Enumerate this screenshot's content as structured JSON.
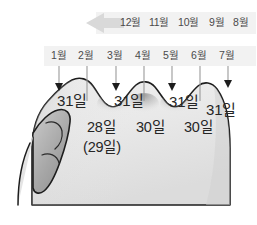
{
  "diagram": {
    "colors": {
      "hand_fill": "#e9e9e9",
      "hand_outline": "#1d1d1d",
      "thumb_fill": "#a8a8a8",
      "band_bg": "#f2f2f2",
      "label_text": "#4a4a4a",
      "days_text": "#262626",
      "pointer_line": "#9a9a9a",
      "arrow_fill": "#d9d9d9",
      "page_bg": "#ffffff"
    },
    "direction_arrow": {
      "name": "leftward-arrow",
      "points": "left"
    },
    "top_row": {
      "label": "second-pass-months",
      "months": [
        "12월",
        "11월",
        "10월",
        "9월",
        "8월"
      ]
    },
    "bottom_row": {
      "label": "first-pass-months",
      "months": [
        "1월",
        "2월",
        "3월",
        "4월",
        "5월",
        "6월",
        "7월"
      ]
    },
    "peaks": {
      "label": "knuckle-peaks-31-days",
      "values": [
        "31일",
        "31일",
        "31일",
        "31일"
      ]
    },
    "valleys": {
      "label": "knuckle-valleys-short-months",
      "values": [
        "28일",
        "30일",
        "30일"
      ],
      "leap_note": "(29일)"
    }
  }
}
